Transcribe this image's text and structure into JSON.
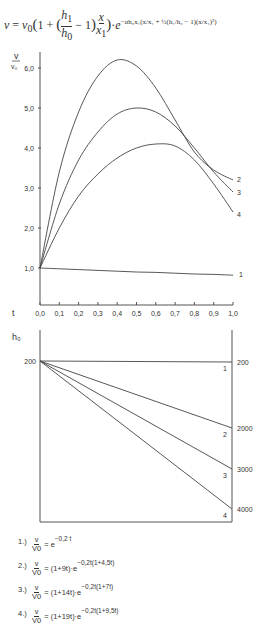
{
  "formula": {
    "text": "v = v0 (1 + (h1/h0 − 1) x/x1) · e^(−αh0x1(x/x1 + 1/2(h1/h0 − 1)(x/x1)²))",
    "lhs": "v = v",
    "lhs_sub": "0",
    "body": "(1 + (h₁/h₀ − 1) x/x₁) · e",
    "exponent": "−αh₀x₁(x/x₁ + ½(h₁/h₀ − 1)(x/x₁)²)"
  },
  "chart_data": [
    {
      "type": "line",
      "title": "",
      "xlabel": "t",
      "ylabel": "v/v0",
      "xlim": [
        0,
        1.0
      ],
      "ylim": [
        0,
        6.5
      ],
      "x_ticks": [
        "0,0",
        "0,1",
        "0,2",
        "0,3",
        "0,4",
        "0,5",
        "0,6",
        "0,7",
        "0,8",
        "0,9",
        "1,0"
      ],
      "y_ticks": [
        "1,0",
        "2,0",
        "3,0",
        "4,0",
        "5,0",
        "6,0"
      ],
      "grid": false,
      "x": [
        0,
        0.1,
        0.2,
        0.3,
        0.4,
        0.5,
        0.6,
        0.7,
        0.8,
        0.9,
        1.0
      ],
      "series": [
        {
          "name": "1",
          "values": [
            1.0,
            0.98,
            0.96,
            0.94,
            0.92,
            0.9,
            0.89,
            0.87,
            0.85,
            0.84,
            0.82
          ]
        },
        {
          "name": "2",
          "values": [
            1.0,
            3.4,
            4.9,
            5.8,
            6.2,
            6.05,
            5.5,
            4.7,
            3.9,
            3.45,
            3.2
          ]
        },
        {
          "name": "3",
          "values": [
            1.0,
            2.6,
            3.7,
            4.4,
            4.85,
            5.0,
            4.9,
            4.55,
            4.0,
            3.4,
            2.9
          ]
        },
        {
          "name": "4",
          "values": [
            1.0,
            2.0,
            2.8,
            3.35,
            3.75,
            4.0,
            4.1,
            4.05,
            3.7,
            3.1,
            2.4
          ]
        }
      ],
      "annotations": [
        "1",
        "2",
        "3",
        "4"
      ]
    },
    {
      "type": "line",
      "title": "",
      "ylabel": "h0",
      "xlim": [
        0,
        1.0
      ],
      "left_tick": "200",
      "right_ticks": [
        "200",
        "2000",
        "3000",
        "4000"
      ],
      "grid": false,
      "x": [
        0,
        1.0
      ],
      "series": [
        {
          "name": "1",
          "start": 200,
          "end": 200
        },
        {
          "name": "2",
          "start": 200,
          "end": 2000
        },
        {
          "name": "3",
          "start": 200,
          "end": 3000
        },
        {
          "name": "4",
          "start": 200,
          "end": 4000
        }
      ],
      "annotations": [
        "1",
        "2",
        "3",
        "4"
      ]
    }
  ],
  "legend": [
    {
      "num": "1.)",
      "num_frac": "v",
      "den_frac": "V0",
      "rhs": "= e",
      "exp": "−0,2 t"
    },
    {
      "num": "2.)",
      "num_frac": "v",
      "den_frac": "V0",
      "rhs": "= (1+9t)·e",
      "exp": "−0,2t(1+4,5t)"
    },
    {
      "num": "3.)",
      "num_frac": "v",
      "den_frac": "V0",
      "rhs": "= (1+14t)·e",
      "exp": "−0,2t(1+7t)"
    },
    {
      "num": "4.)",
      "num_frac": "v",
      "den_frac": "V0",
      "rhs": "= (1+19t)·e",
      "exp": "−0,2t(1+9,5t)"
    }
  ],
  "colors": {
    "line": "#444444",
    "axis": "#555555",
    "text": "#333333"
  }
}
